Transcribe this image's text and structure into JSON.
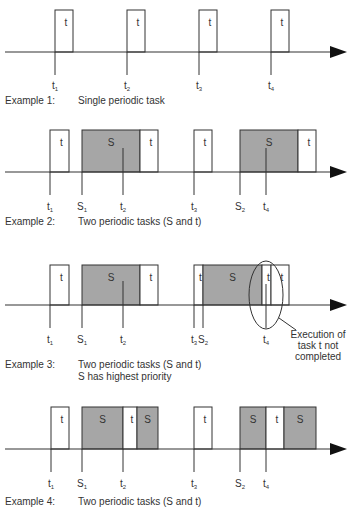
{
  "colors": {
    "line": "#333333",
    "s_fill": "#a6a6a6",
    "t_fill": "#ffffff",
    "text": "#333333"
  },
  "examples": [
    {
      "id": "example-1",
      "axis_y": 52,
      "box_top": 10,
      "tick_bottom": 75,
      "label_y": 89,
      "caption_y": 104,
      "caption_label": "Example 1:",
      "caption_lines": [
        "Single periodic task"
      ],
      "boxes": [
        {
          "task": "t",
          "x": 55,
          "w": 18,
          "text": "t"
        },
        {
          "task": "t",
          "x": 127,
          "w": 18,
          "text": "t"
        },
        {
          "task": "t",
          "x": 199,
          "w": 18,
          "text": "t"
        },
        {
          "task": "t",
          "x": 271,
          "w": 18,
          "text": "t"
        }
      ],
      "ticks": [
        {
          "x": 55,
          "label": "t",
          "sub": "1",
          "top": 52
        },
        {
          "x": 127,
          "label": "t",
          "sub": "2",
          "top": 52
        },
        {
          "x": 199,
          "label": "t",
          "sub": "3",
          "top": 52
        },
        {
          "x": 271,
          "label": "t",
          "sub": "4",
          "top": 52
        }
      ]
    },
    {
      "id": "example-2",
      "axis_y": 172,
      "box_top": 130,
      "tick_bottom": 195,
      "label_y": 210,
      "caption_y": 225,
      "caption_label": "Example 2:",
      "caption_lines": [
        "Two periodic tasks (S and t)"
      ],
      "boxes": [
        {
          "task": "t",
          "x": 50,
          "w": 19,
          "text": "t"
        },
        {
          "task": "S",
          "x": 82,
          "w": 58,
          "text": "S"
        },
        {
          "task": "t",
          "x": 140,
          "w": 18,
          "text": "t"
        },
        {
          "task": "t",
          "x": 194,
          "w": 18,
          "text": "t"
        },
        {
          "task": "S",
          "x": 240,
          "w": 58,
          "text": "S"
        },
        {
          "task": "t",
          "x": 298,
          "w": 18,
          "text": "t"
        }
      ],
      "ticks": [
        {
          "x": 50,
          "label": "t",
          "sub": "1",
          "top": 172
        },
        {
          "x": 82,
          "label": "S",
          "sub": "1",
          "top": 172
        },
        {
          "x": 123,
          "label": "t",
          "sub": "2",
          "top": 148
        },
        {
          "x": 194,
          "label": "t",
          "sub": "3",
          "top": 172
        },
        {
          "x": 240,
          "label": "S",
          "sub": "2",
          "top": 172
        },
        {
          "x": 266,
          "label": "t",
          "sub": "4",
          "top": 148
        }
      ]
    },
    {
      "id": "example-3",
      "axis_y": 305,
      "box_top": 265,
      "tick_bottom": 328,
      "label_y": 343,
      "caption_y": 368,
      "caption_label": "Example 3:",
      "caption_lines": [
        "Two periodic tasks (S and t)",
        "S has highest priority"
      ],
      "boxes": [
        {
          "task": "t",
          "x": 50,
          "w": 19,
          "text": "t"
        },
        {
          "task": "S",
          "x": 82,
          "w": 58,
          "text": "S"
        },
        {
          "task": "t",
          "x": 140,
          "w": 18,
          "text": "t"
        },
        {
          "task": "t",
          "x": 194,
          "w": 9,
          "text": "t"
        },
        {
          "task": "S",
          "x": 203,
          "w": 59,
          "text": "S"
        },
        {
          "task": "t",
          "x": 262,
          "w": 9,
          "text": "t"
        },
        {
          "task": "t",
          "x": 271,
          "w": 18,
          "text": "t"
        }
      ],
      "ticks": [
        {
          "x": 50,
          "label": "t",
          "sub": "1",
          "top": 305
        },
        {
          "x": 82,
          "label": "S",
          "sub": "1",
          "top": 305
        },
        {
          "x": 123,
          "label": "t",
          "sub": "2",
          "top": 281
        },
        {
          "x": 194,
          "label": "t",
          "sub": "3",
          "top": 305
        },
        {
          "x": 203,
          "label": "S",
          "sub": "2",
          "top": 305
        },
        {
          "x": 266,
          "label": "t",
          "sub": "4",
          "top": 284
        }
      ],
      "annotation": {
        "ellipse": {
          "cx": 266,
          "cy": 295,
          "rx": 17,
          "ry": 34
        },
        "leader": {
          "x1": 279,
          "y1": 318,
          "x2": 296,
          "y2": 330
        },
        "x": 318,
        "y": 338,
        "lines": [
          "Execution of",
          "task t not",
          "completed"
        ]
      }
    },
    {
      "id": "example-4",
      "axis_y": 449,
      "box_top": 407,
      "tick_bottom": 472,
      "label_y": 487,
      "caption_y": 505,
      "caption_label": "Example 4:",
      "caption_lines": [
        "Two periodic tasks (S and t)"
      ],
      "boxes": [
        {
          "task": "t",
          "x": 51,
          "w": 18,
          "text": "t"
        },
        {
          "task": "S",
          "x": 82,
          "w": 41,
          "text": "S"
        },
        {
          "task": "t",
          "x": 123,
          "w": 14,
          "text": "t"
        },
        {
          "task": "S",
          "x": 137,
          "w": 21,
          "text": "S"
        },
        {
          "task": "t",
          "x": 194,
          "w": 18,
          "text": "t"
        },
        {
          "task": "S",
          "x": 240,
          "w": 26,
          "text": "S"
        },
        {
          "task": "t",
          "x": 266,
          "w": 18,
          "text": "t"
        },
        {
          "task": "S",
          "x": 284,
          "w": 32,
          "text": "S"
        }
      ],
      "ticks": [
        {
          "x": 51,
          "label": "t",
          "sub": "1",
          "top": 449
        },
        {
          "x": 82,
          "label": "S",
          "sub": "1",
          "top": 449
        },
        {
          "x": 123,
          "label": "t",
          "sub": "2",
          "top": 449
        },
        {
          "x": 194,
          "label": "t",
          "sub": "3",
          "top": 449
        },
        {
          "x": 240,
          "label": "S",
          "sub": "2",
          "top": 449
        },
        {
          "x": 266,
          "label": "t",
          "sub": "4",
          "top": 449
        }
      ]
    }
  ],
  "axis": {
    "x_start": 5,
    "x_end": 330,
    "arrow_tip": 347
  }
}
